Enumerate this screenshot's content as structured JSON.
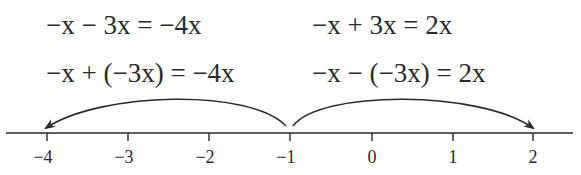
{
  "equations": {
    "left": {
      "line1": "−x − 3x = −4x",
      "line2": "−x + (−3x) = −4x"
    },
    "right": {
      "line1": "−x + 3x = 2x",
      "line2": "−x − (−3x) = 2x"
    }
  },
  "number_line": {
    "ticks": [
      {
        "value": "−4",
        "x": 47
      },
      {
        "value": "−3",
        "x": 128
      },
      {
        "value": "−2",
        "x": 209
      },
      {
        "value": "−1",
        "x": 290
      },
      {
        "value": "0",
        "x": 372
      },
      {
        "value": "1",
        "x": 453
      },
      {
        "value": "2",
        "x": 533
      }
    ],
    "arrows": [
      {
        "from": "−1",
        "to": "−4",
        "direction": "left"
      },
      {
        "from": "−1",
        "to": "2",
        "direction": "right"
      }
    ],
    "line_color": "#2a2a2a"
  }
}
